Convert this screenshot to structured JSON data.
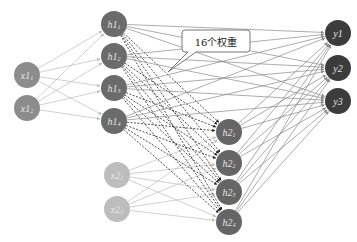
{
  "diagram": {
    "title": "",
    "colors": {
      "x1": "#8c8c8c",
      "h1": "#6b6b6b",
      "h2": "#656565",
      "x2": "#bdbdbd",
      "y": "#3c3c3c",
      "edge": "#8a8a8a",
      "edge_light": "#bcbcbc",
      "dashed": "#222222",
      "label": "#e6e6e6"
    },
    "radius": 13,
    "layers": {
      "x1": [
        {
          "id": "x1_1",
          "base": "x1",
          "sub": "1",
          "cx": 27,
          "cy": 75
        },
        {
          "id": "x1_2",
          "base": "x1",
          "sub": "2",
          "cx": 27,
          "cy": 108
        }
      ],
      "h1": [
        {
          "id": "h1_1",
          "base": "h1",
          "sub": "1",
          "cx": 114,
          "cy": 24
        },
        {
          "id": "h1_2",
          "base": "h1",
          "sub": "2",
          "cx": 114,
          "cy": 56
        },
        {
          "id": "h1_3",
          "base": "h1",
          "sub": "3",
          "cx": 114,
          "cy": 88
        },
        {
          "id": "h1_4",
          "base": "h1",
          "sub": "4",
          "cx": 114,
          "cy": 121
        }
      ],
      "x2": [
        {
          "id": "x2_1",
          "base": "x2",
          "sub": "1",
          "cx": 117,
          "cy": 175
        },
        {
          "id": "x2_2",
          "base": "x2",
          "sub": "2",
          "cx": 117,
          "cy": 209
        }
      ],
      "h2": [
        {
          "id": "h2_1",
          "base": "h2",
          "sub": "1",
          "cx": 229,
          "cy": 132
        },
        {
          "id": "h2_2",
          "base": "h2",
          "sub": "2",
          "cx": 229,
          "cy": 163
        },
        {
          "id": "h2_3",
          "base": "h2",
          "sub": "3",
          "cx": 229,
          "cy": 192
        },
        {
          "id": "h2_4",
          "base": "h2",
          "sub": "4",
          "cx": 229,
          "cy": 222
        }
      ],
      "y": [
        {
          "id": "y1",
          "base": "y1",
          "sub": "",
          "cx": 338,
          "cy": 33
        },
        {
          "id": "y2",
          "base": "y2",
          "sub": "",
          "cx": 338,
          "cy": 68
        },
        {
          "id": "y3",
          "base": "y3",
          "sub": "",
          "cx": 338,
          "cy": 101
        }
      ]
    },
    "connections": [
      {
        "from": "x1",
        "to": "h1",
        "style": "solid-light"
      },
      {
        "from": "x2",
        "to": "h2",
        "style": "solid-light"
      },
      {
        "from": "h1",
        "to": "h2",
        "style": "dashed"
      },
      {
        "from": "h1",
        "to": "y",
        "style": "solid"
      },
      {
        "from": "h2",
        "to": "y",
        "style": "solid"
      }
    ],
    "callout": {
      "text": "16个权重",
      "x": 182,
      "y": 30,
      "width": 68,
      "height": 22,
      "tail_to": [
        168,
        72
      ]
    }
  }
}
